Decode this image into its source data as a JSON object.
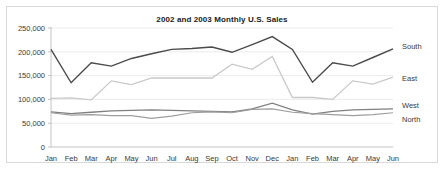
{
  "chart_data": {
    "type": "line",
    "title": "2002 and 2003 Monthly U.S. Sales",
    "xlabel": "",
    "ylabel": "",
    "ylim": [
      0,
      250000
    ],
    "yticks": [
      0,
      50000,
      100000,
      150000,
      200000,
      250000
    ],
    "ytick_labels": [
      "0",
      "50,000",
      "100,000",
      "150,000",
      "200,000",
      "250,000"
    ],
    "grid": true,
    "legend_position": "right-inline",
    "categories": [
      "Jan",
      "Feb",
      "Mar",
      "Apr",
      "May",
      "Jun",
      "Jul",
      "Aug",
      "Sep",
      "Oct",
      "Nov",
      "Dec",
      "Jan",
      "Feb",
      "Mar",
      "Apr",
      "May",
      "Jun"
    ],
    "series": [
      {
        "name": "South",
        "color": "#4a4a4a",
        "values": [
          205000,
          135000,
          177000,
          170000,
          186000,
          196000,
          205000,
          207000,
          210000,
          199000,
          215000,
          232000,
          205000,
          136000,
          177000,
          170000,
          188000,
          206000
        ]
      },
      {
        "name": "East",
        "color": "#c9c9c9",
        "values": [
          102000,
          103000,
          99000,
          139000,
          131000,
          145000,
          145000,
          145000,
          145000,
          174000,
          163000,
          190000,
          104000,
          104000,
          100000,
          139000,
          132000,
          147000
        ]
      },
      {
        "name": "West",
        "color": "#808080",
        "values": [
          74000,
          70000,
          73000,
          76000,
          77000,
          78000,
          77000,
          76000,
          75000,
          74000,
          80000,
          92000,
          78000,
          69000,
          75000,
          78000,
          79000,
          80000
        ]
      },
      {
        "name": "North",
        "color": "#9e9e9e",
        "values": [
          72000,
          67000,
          68000,
          66000,
          66000,
          60000,
          65000,
          72000,
          74000,
          72000,
          79000,
          80000,
          73000,
          70000,
          68000,
          66000,
          68000,
          72000
        ]
      }
    ]
  }
}
